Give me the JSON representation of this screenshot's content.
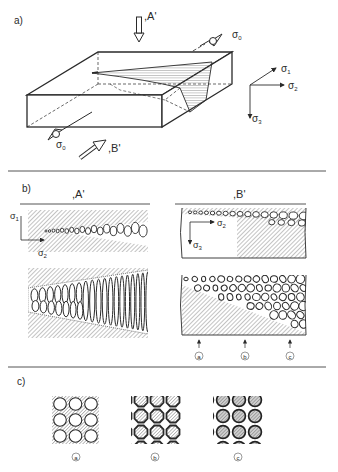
{
  "panel_a": {
    "label": "a)",
    "view_a_label": ",A'",
    "view_b_label": ",B'",
    "sigma0": "σ",
    "sigma0_sub": "0",
    "axes": [
      {
        "symbol": "σ",
        "sub": "1"
      },
      {
        "symbol": "σ",
        "sub": "2"
      },
      {
        "symbol": "σ",
        "sub": "3"
      }
    ]
  },
  "panel_b": {
    "label": "b)",
    "view_a_title": ",A'",
    "view_b_title": ",B'",
    "view_a_axes": [
      {
        "symbol": "σ",
        "sub": "1"
      },
      {
        "symbol": "σ",
        "sub": "2"
      }
    ],
    "view_b_axes": [
      {
        "symbol": "σ",
        "sub": "2"
      },
      {
        "symbol": "σ",
        "sub": "3"
      }
    ],
    "markers": [
      "a",
      "b",
      "c"
    ]
  },
  "panel_c": {
    "label": "c)",
    "patterns": [
      {
        "id": "a",
        "caption": "a",
        "description": "circular pores in hatched matrix"
      },
      {
        "id": "b",
        "caption": "b",
        "description": "octagonal hatched grains in white network"
      },
      {
        "id": "c",
        "caption": "c",
        "description": "shaded round grains with dark rims"
      }
    ]
  },
  "colors": {
    "ink": "#2a2a2a",
    "hatch": "#8a8a8a",
    "rule": "#555555",
    "paper": "#ffffff"
  }
}
